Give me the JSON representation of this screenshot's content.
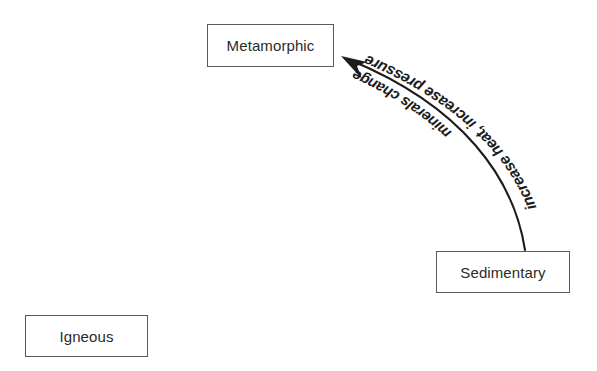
{
  "diagram": {
    "type": "rock-cycle-flow",
    "background_color": "#ffffff",
    "stroke_color": "#1c1c1c",
    "box_border_color": "#5a5a5a",
    "text_color": "#2b2b2b",
    "nodes": [
      {
        "id": "metamorphic",
        "label": "Metamorphic",
        "x": 207,
        "y": 24,
        "width": 127,
        "height": 43
      },
      {
        "id": "sedimentary",
        "label": "Sedimentary",
        "x": 436,
        "y": 251,
        "width": 134,
        "height": 42
      },
      {
        "id": "igneous",
        "label": "Igneous",
        "x": 25,
        "y": 315,
        "width": 123,
        "height": 42
      }
    ],
    "edges": [
      {
        "id": "sedimentary-to-metamorphic",
        "from": "sedimentary",
        "to": "metamorphic",
        "shape": "curved-arc",
        "arrowhead": "solid-triangle",
        "arrowhead_at": "metamorphic",
        "start_point": [
          525,
          250
        ],
        "end_point": [
          344,
          58
        ],
        "label_outer": "increase heat, increase pressure",
        "label_inner": "minerals change"
      }
    ]
  }
}
